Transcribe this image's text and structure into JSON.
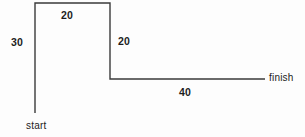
{
  "diagram": {
    "type": "line-path",
    "background_color": "#fdfdfd",
    "stroke_color": "#3a3a3a",
    "stroke_width": 1.4,
    "endpoints": {
      "start_label": "start",
      "finish_label": "finish"
    },
    "segments": [
      {
        "id": "seg-30",
        "label": "30",
        "orientation": "vertical",
        "direction": "up",
        "from": [
          35,
          113
        ],
        "to": [
          35,
          3
        ]
      },
      {
        "id": "seg-20-top",
        "label": "20",
        "orientation": "horizontal",
        "direction": "right",
        "from": [
          35,
          3
        ],
        "to": [
          110,
          3
        ]
      },
      {
        "id": "seg-20-right",
        "label": "20",
        "orientation": "vertical",
        "direction": "down",
        "from": [
          110,
          3
        ],
        "to": [
          110,
          79
        ]
      },
      {
        "id": "seg-40",
        "label": "40",
        "orientation": "horizontal",
        "direction": "right",
        "from": [
          110,
          79
        ],
        "to": [
          265,
          79
        ]
      }
    ],
    "path_d": "M 35 113 L 35 3 L 110 3 L 110 79 L 265 79"
  }
}
